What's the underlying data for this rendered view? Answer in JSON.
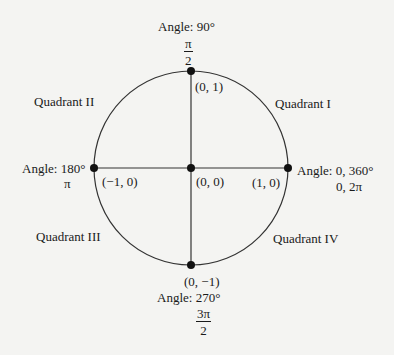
{
  "diagram": {
    "circle": {
      "cx": 191,
      "cy": 168,
      "r": 97,
      "stroke": "#333333"
    },
    "points": [
      {
        "name": "top",
        "coord": "(0, 1)",
        "angle_deg": "Angle: 90°",
        "angle_rad_num": "π",
        "angle_rad_den": "2"
      },
      {
        "name": "left",
        "coord": "(−1, 0)",
        "angle_deg": "Angle: 180°",
        "angle_rad": "π"
      },
      {
        "name": "center",
        "coord": "(0, 0)"
      },
      {
        "name": "right",
        "coord": "(1, 0)",
        "angle_deg": "Angle: 0, 360°",
        "angle_rad": "0, 2π"
      },
      {
        "name": "bottom",
        "coord": "(0, −1)",
        "angle_deg": "Angle: 270°",
        "angle_rad_num": "3π",
        "angle_rad_den": "2"
      }
    ],
    "quadrants": [
      "Quadrant I",
      "Quadrant II",
      "Quadrant III",
      "Quadrant IV"
    ]
  }
}
